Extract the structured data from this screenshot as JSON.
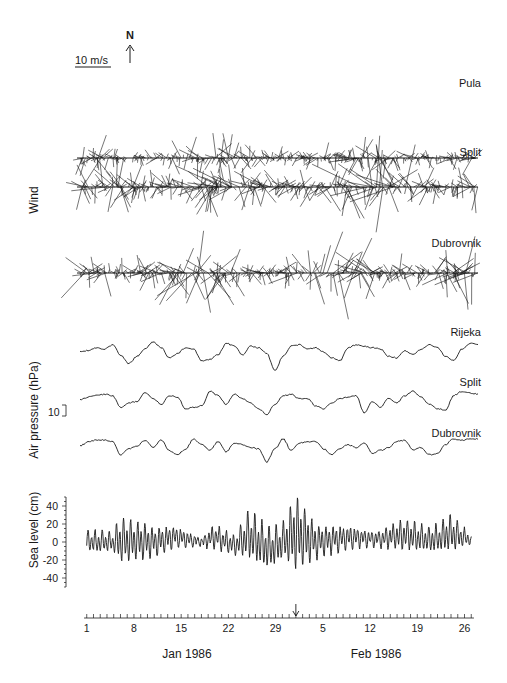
{
  "figure": {
    "scale_label": "10 m/s",
    "north_label": "N",
    "wind_axis_title": "Wind",
    "pressure_axis_title": "Air pressure (hPa)",
    "pressure_scale_label": "10",
    "sea_axis_title": "Sea level (cm)"
  },
  "chart_data": [
    {
      "type": "stick",
      "title": "Wind",
      "series": [
        {
          "name": "Pula",
          "seed": 11,
          "amp": 0.55,
          "baseline_y": 158
        },
        {
          "name": "Split",
          "seed": 23,
          "amp": 1.0,
          "baseline_y": 187
        },
        {
          "name": "Dubrovnik",
          "seed": 37,
          "amp": 0.85,
          "baseline_y": 273
        }
      ],
      "scale": {
        "label": "10 m/s",
        "length_px": 30
      },
      "north_arrow": "N"
    },
    {
      "type": "line",
      "title": "Air pressure (hPa)",
      "ylabel": "Air pressure (hPa)",
      "scale_bar": 10,
      "series": [
        {
          "name": "Rijeka",
          "values": [
            0,
            1,
            3,
            2,
            5,
            -2,
            -8,
            -3,
            2,
            7,
            3,
            -4,
            -1,
            3,
            2,
            -6,
            -5,
            -2,
            6,
            4,
            -2,
            4,
            3,
            -1,
            -13,
            -3,
            4,
            5,
            2,
            3,
            0,
            -4,
            -6,
            3,
            5,
            4,
            3,
            2,
            -3,
            -4,
            1,
            -2,
            2,
            5,
            3,
            -3,
            -6,
            2,
            6,
            5
          ]
        },
        {
          "name": "Split",
          "values": [
            0,
            2,
            3,
            4,
            3,
            -5,
            -2,
            -1,
            5,
            1,
            -3,
            3,
            2,
            -6,
            -5,
            -4,
            6,
            3,
            -3,
            4,
            1,
            -2,
            -6,
            -10,
            -3,
            3,
            4,
            1,
            1,
            -4,
            -6,
            -2,
            1,
            2,
            3,
            -9,
            -1,
            -5,
            1,
            -2,
            3,
            6,
            2,
            -3,
            -6,
            -7,
            3,
            6,
            5,
            4
          ]
        },
        {
          "name": "Dubrovnik",
          "values": [
            0,
            3,
            4,
            4,
            3,
            -6,
            -2,
            0,
            4,
            -1,
            4,
            -3,
            -6,
            -2,
            5,
            1,
            -3,
            3,
            -4,
            2,
            1,
            -1,
            -2,
            -11,
            -2,
            5,
            -3,
            2,
            3,
            3,
            -2,
            -6,
            -2,
            1,
            -1,
            2,
            -5,
            -3,
            -1,
            3,
            4,
            -3,
            -1,
            -6,
            -5,
            1,
            5,
            4,
            5,
            5
          ]
        }
      ]
    },
    {
      "type": "line",
      "title": "Sea level",
      "ylabel": "Sea level (cm)",
      "ylim": [
        -50,
        50
      ],
      "yticks": [
        40,
        20,
        0,
        -20,
        -40
      ],
      "x_tick_labels": [
        "1",
        "8",
        "15",
        "22",
        "29",
        "5",
        "12",
        "19",
        "26"
      ],
      "x_tick_days": [
        1,
        8,
        15,
        22,
        29,
        36,
        43,
        50,
        57
      ],
      "x_range_days": [
        0,
        59
      ],
      "month_labels": [
        "Jan 1986",
        "Feb 1986"
      ],
      "marker": {
        "type": "arrow",
        "day": 32
      },
      "series": [
        {
          "name": "Sea level",
          "envelope": [
            {
              "day": 1,
              "amp": 14,
              "mean": 0
            },
            {
              "day": 5,
              "amp": 14,
              "mean": 0
            },
            {
              "day": 6,
              "amp": 30,
              "mean": 2
            },
            {
              "day": 11,
              "amp": 20,
              "mean": 0
            },
            {
              "day": 14,
              "amp": 14,
              "mean": 6
            },
            {
              "day": 18,
              "amp": 6,
              "mean": 0
            },
            {
              "day": 20,
              "amp": 16,
              "mean": 6
            },
            {
              "day": 23,
              "amp": 12,
              "mean": -4
            },
            {
              "day": 25,
              "amp": 32,
              "mean": 8
            },
            {
              "day": 28,
              "amp": 28,
              "mean": -8
            },
            {
              "day": 30,
              "amp": 22,
              "mean": 0
            },
            {
              "day": 32,
              "amp": 50,
              "mean": 10
            },
            {
              "day": 35,
              "amp": 22,
              "mean": 0
            },
            {
              "day": 40,
              "amp": 15,
              "mean": 5
            },
            {
              "day": 44,
              "amp": 10,
              "mean": 3
            },
            {
              "day": 48,
              "amp": 20,
              "mean": 8
            },
            {
              "day": 52,
              "amp": 16,
              "mean": 2
            },
            {
              "day": 55,
              "amp": 24,
              "mean": 10
            },
            {
              "day": 58,
              "amp": 6,
              "mean": 2
            }
          ]
        }
      ]
    }
  ]
}
